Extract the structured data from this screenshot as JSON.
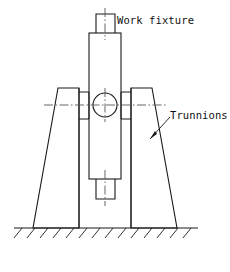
{
  "drawing": {
    "title": "Work fixture mounted on trunnions",
    "background_color": "#ffffff",
    "line_color": "#1a1a1a",
    "centerline_color": "#555555",
    "labels": {
      "work_fixture": "Work fixture",
      "trunnions": "Trunnions"
    },
    "parts": {
      "top_stub_name": "top-stub",
      "main_body_name": "fixture-body",
      "bottom_stub_name": "bottom-stub",
      "pivot_hole_name": "pivot-hole",
      "left_trunnion_name": "left-trunnion-support",
      "right_trunnion_name": "right-trunnion-support",
      "ground_name": "ground-hatching"
    },
    "geometry": {
      "pivot_center_x": 105,
      "pivot_center_y": 105,
      "pivot_radius": 12,
      "ground_y": 228,
      "ground_x1": 14,
      "ground_x2": 198
    }
  }
}
